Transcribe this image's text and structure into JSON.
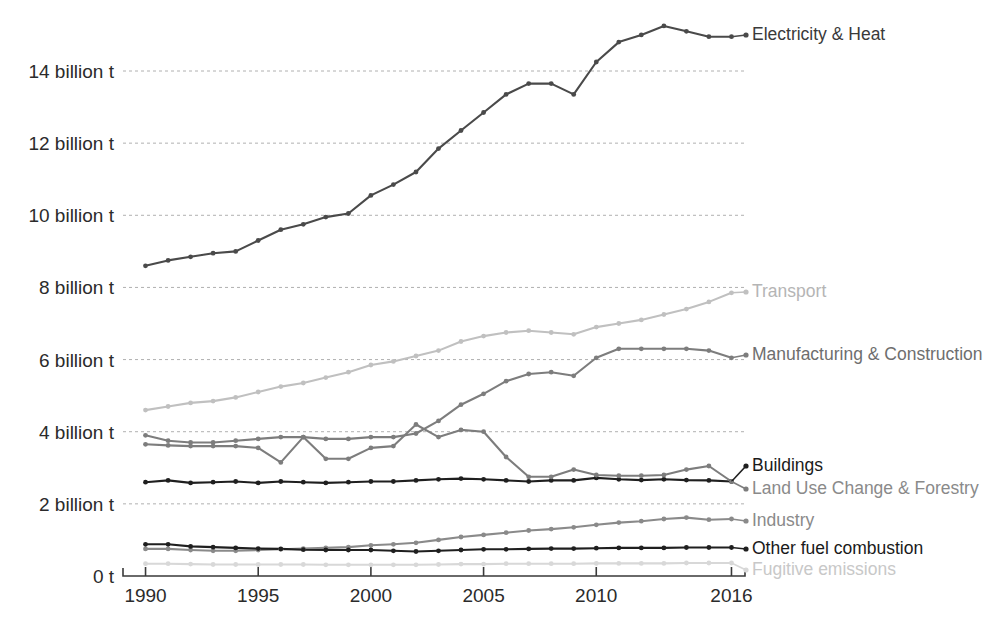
{
  "chart_data": {
    "type": "line",
    "title": "",
    "subtitle": "",
    "xlabel": "",
    "ylabel": "",
    "grid": "horizontal dashed gridlines at every 2 billion t",
    "legend_position": "right of plot, inline at end of each line",
    "x": [
      1990,
      1991,
      1992,
      1993,
      1994,
      1995,
      1996,
      1997,
      1998,
      1999,
      2000,
      2001,
      2002,
      2003,
      2004,
      2005,
      2006,
      2007,
      2008,
      2009,
      2010,
      2011,
      2012,
      2013,
      2014,
      2015,
      2016
    ],
    "xlim": [
      1989,
      2016.6
    ],
    "ylim": [
      0,
      15.6
    ],
    "xticks": [
      1990,
      1995,
      2000,
      2005,
      2010,
      2016
    ],
    "xtick_labels": [
      "1990",
      "1995",
      "2000",
      "2005",
      "2010",
      "2016"
    ],
    "yticks": [
      0,
      2,
      4,
      6,
      8,
      10,
      12,
      14
    ],
    "ytick_labels": [
      "0 t",
      "2 billion t",
      "4 billion t",
      "6 billion t",
      "8 billion t",
      "10 billion t",
      "12 billion t",
      "14 billion t"
    ],
    "series": [
      {
        "name": "Electricity & Heat",
        "color": "#4a4a4a",
        "label_color": "#3a3a3a",
        "values": [
          8.6,
          8.75,
          8.85,
          8.95,
          9.0,
          9.3,
          9.6,
          9.75,
          9.95,
          10.05,
          10.55,
          10.85,
          11.2,
          11.85,
          12.35,
          12.85,
          13.35,
          13.65,
          13.65,
          13.35,
          14.25,
          14.8,
          15.0,
          15.25,
          15.1,
          14.95,
          14.95
        ]
      },
      {
        "name": "Transport",
        "color": "#c0c0c0",
        "label_color": "#b5b5b5",
        "values": [
          4.6,
          4.7,
          4.8,
          4.85,
          4.95,
          5.1,
          5.25,
          5.35,
          5.5,
          5.65,
          5.85,
          5.95,
          6.1,
          6.25,
          6.5,
          6.65,
          6.75,
          6.8,
          6.75,
          6.7,
          6.9,
          7.0,
          7.1,
          7.25,
          7.4,
          7.6,
          7.85
        ]
      },
      {
        "name": "Manufacturing & Construction",
        "color": "#7d7d7d",
        "label_color": "#6e6e6e",
        "values": [
          3.9,
          3.75,
          3.7,
          3.7,
          3.75,
          3.8,
          3.85,
          3.85,
          3.8,
          3.8,
          3.85,
          3.85,
          3.95,
          4.3,
          4.75,
          5.05,
          5.4,
          5.6,
          5.65,
          5.55,
          6.05,
          6.3,
          6.3,
          6.3,
          6.3,
          6.25,
          6.05
        ]
      },
      {
        "name": "Buildings",
        "color": "#1f1f1f",
        "label_color": "#1a1a1a",
        "values": [
          2.6,
          2.65,
          2.58,
          2.6,
          2.62,
          2.58,
          2.62,
          2.6,
          2.58,
          2.6,
          2.62,
          2.62,
          2.65,
          2.68,
          2.7,
          2.68,
          2.65,
          2.62,
          2.65,
          2.65,
          2.72,
          2.68,
          2.66,
          2.68,
          2.66,
          2.65,
          2.62
        ]
      },
      {
        "name": "Land Use Change & Forestry",
        "color": "#7d7d7d",
        "label_color": "#8a8a8a",
        "values": [
          3.65,
          3.62,
          3.6,
          3.6,
          3.6,
          3.55,
          3.15,
          3.85,
          3.25,
          3.25,
          3.55,
          3.6,
          4.2,
          3.85,
          4.05,
          4.0,
          3.3,
          2.75,
          2.75,
          2.95,
          2.8,
          2.78,
          2.78,
          2.8,
          2.95,
          3.05,
          2.62
        ]
      },
      {
        "name": "Industry",
        "color": "#8a8a8a",
        "label_color": "#8a8a8a",
        "values": [
          0.75,
          0.75,
          0.72,
          0.7,
          0.7,
          0.72,
          0.74,
          0.76,
          0.78,
          0.8,
          0.85,
          0.88,
          0.92,
          1.0,
          1.08,
          1.14,
          1.2,
          1.26,
          1.3,
          1.35,
          1.42,
          1.48,
          1.52,
          1.58,
          1.62,
          1.56,
          1.58
        ]
      },
      {
        "name": "Other fuel combustion",
        "color": "#1f1f1f",
        "label_color": "#1a1a1a",
        "values": [
          0.88,
          0.88,
          0.82,
          0.8,
          0.78,
          0.76,
          0.75,
          0.73,
          0.72,
          0.72,
          0.72,
          0.7,
          0.68,
          0.7,
          0.72,
          0.74,
          0.74,
          0.75,
          0.76,
          0.76,
          0.77,
          0.78,
          0.78,
          0.78,
          0.79,
          0.79,
          0.79
        ]
      },
      {
        "name": "Fugitive emissions",
        "color": "#d8d8d8",
        "label_color": "#c8c8c8",
        "values": [
          0.34,
          0.34,
          0.33,
          0.32,
          0.32,
          0.32,
          0.32,
          0.32,
          0.31,
          0.31,
          0.31,
          0.31,
          0.31,
          0.32,
          0.33,
          0.33,
          0.34,
          0.34,
          0.34,
          0.34,
          0.35,
          0.35,
          0.35,
          0.35,
          0.36,
          0.36,
          0.36
        ]
      }
    ],
    "label_anchors": [
      {
        "series": "Electricity & Heat",
        "y_label": 35
      },
      {
        "series": "Transport",
        "y_label": 292
      },
      {
        "series": "Manufacturing & Construction",
        "y_label": 355
      },
      {
        "series": "Buildings",
        "y_label": 466
      },
      {
        "series": "Land Use Change & Forestry",
        "y_label": 489
      },
      {
        "series": "Industry",
        "y_label": 521
      },
      {
        "series": "Other fuel combustion",
        "y_label": 549
      },
      {
        "series": "Fugitive emissions",
        "y_label": 570
      }
    ]
  },
  "style": {
    "gridline_color": "#b0b0b0",
    "axis_color": "#3a3a3a",
    "background": "#ffffff",
    "tick_text_color": "#2b2b2b"
  }
}
